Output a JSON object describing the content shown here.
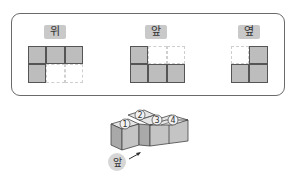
{
  "views": [
    {
      "id": "top",
      "label": "위",
      "label_pos": {
        "x": 44,
        "y": 25,
        "w": 22
      },
      "grid_pos": {
        "x": 28,
        "y": 46
      },
      "cell_size": 18.3,
      "cols": 3,
      "rows": 2,
      "cells": [
        [
          1,
          1,
          1
        ],
        [
          1,
          0,
          0
        ]
      ]
    },
    {
      "id": "front",
      "label": "앞",
      "label_pos": {
        "x": 145,
        "y": 25,
        "w": 22
      },
      "grid_pos": {
        "x": 130,
        "y": 46
      },
      "cell_size": 18.3,
      "cols": 3,
      "rows": 2,
      "cells": [
        [
          1,
          0,
          0
        ],
        [
          1,
          1,
          1
        ]
      ]
    },
    {
      "id": "side",
      "label": "옆",
      "label_pos": {
        "x": 238,
        "y": 25,
        "w": 22
      },
      "grid_pos": {
        "x": 231,
        "y": 46
      },
      "cell_size": 18.3,
      "cols": 2,
      "rows": 2,
      "cells": [
        [
          0,
          1
        ],
        [
          1,
          1
        ]
      ]
    }
  ],
  "figure": {
    "cube_numbers": [
      "1",
      "2",
      "3",
      "4"
    ],
    "front_label": "앞"
  },
  "colors": {
    "filled": "#bdbdbd",
    "label_bg": "#c9c9c9",
    "frame": "#6a6a6a"
  }
}
